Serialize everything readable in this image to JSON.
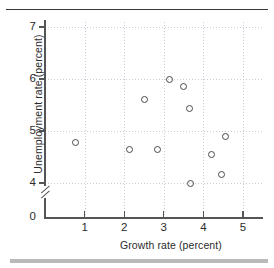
{
  "page": {
    "header_ghost": "",
    "rule_top": "horizontal-rule",
    "rule_bottom": "horizontal-bar"
  },
  "chart_data": {
    "type": "scatter",
    "title": "",
    "xlabel": "Growth rate (percent)",
    "ylabel": "Unemployment rate (percent)",
    "xlim": [
      0,
      5.5
    ],
    "ylim": [
      3.72,
      7.35
    ],
    "y_axis_break": true,
    "y_axis_break_label": "0",
    "grid": true,
    "legend": null,
    "xticks": [
      1,
      2,
      3,
      4,
      5
    ],
    "xtick_labels": [
      "1",
      "2",
      "3",
      "4",
      "5"
    ],
    "yticks": [
      4,
      5,
      6,
      7
    ],
    "ytick_labels": [
      "4",
      "5",
      "6",
      "7"
    ],
    "origin_label": "0",
    "points": [
      {
        "x": 0.78,
        "y": 4.77
      },
      {
        "x": 2.13,
        "y": 4.65
      },
      {
        "x": 2.5,
        "y": 5.6
      },
      {
        "x": 2.85,
        "y": 4.65
      },
      {
        "x": 3.15,
        "y": 5.99
      },
      {
        "x": 3.5,
        "y": 5.86
      },
      {
        "x": 3.65,
        "y": 5.43
      },
      {
        "x": 3.67,
        "y": 4.0
      },
      {
        "x": 4.2,
        "y": 4.55
      },
      {
        "x": 4.45,
        "y": 4.16
      },
      {
        "x": 4.55,
        "y": 4.9
      }
    ]
  }
}
